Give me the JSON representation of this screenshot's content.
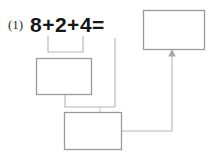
{
  "page": {
    "width": 209,
    "height": 159,
    "background": "#ffffff",
    "ink_color": "#1a1a1a",
    "box_stroke_color": "#9a9a9a",
    "connector_color": "#b0b0b0"
  },
  "problem": {
    "number_label": "(1)",
    "equation": "8+2+4=",
    "operands": [
      "8",
      "2",
      "4"
    ],
    "operators": [
      "+",
      "+"
    ],
    "equals_sign": "="
  },
  "answer_boxes": [
    {
      "id": "result-box",
      "name": "result-answer-box",
      "value": "",
      "x": 143,
      "y": 10,
      "width": 62,
      "height": 40
    },
    {
      "id": "first-step-box",
      "name": "first-step-answer-box",
      "value": "",
      "x": 36,
      "y": 58,
      "width": 56,
      "height": 37
    },
    {
      "id": "second-step-box",
      "name": "second-step-answer-box",
      "value": "",
      "x": 64,
      "y": 112,
      "width": 58,
      "height": 38
    }
  ],
  "connectors": [
    {
      "id": "brace-8-plus-2",
      "name": "brace-under-8-plus-2",
      "description": "bracket under 8+2 leading down to first step box"
    },
    {
      "id": "first-step-to-second-step",
      "name": "connector-first-step-to-second-step",
      "description": "line from first step box down and right into second step box"
    },
    {
      "id": "four-to-second-step",
      "name": "connector-four-to-second-step",
      "description": "line from the 4 term down into second step box"
    },
    {
      "id": "second-step-to-result",
      "name": "connector-second-step-to-result",
      "description": "arrow from second step box right and up into result box"
    }
  ],
  "arrow": {
    "name": "arrowhead-into-result-box",
    "direction": "up"
  }
}
